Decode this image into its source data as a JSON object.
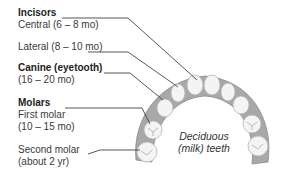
{
  "diagram": {
    "caption_line1": "Deciduous",
    "caption_line2": "(milk) teeth",
    "groups": [
      {
        "heading": "Incisors",
        "items": [
          {
            "name": "Central",
            "age": "Central (6 – 8 mo)"
          },
          {
            "name": "Lateral",
            "age": "Lateral (8 – 10 mo)"
          }
        ]
      },
      {
        "heading": "Canine (eyetooth)",
        "items": [
          {
            "name": "Canine",
            "age": "(16 – 20 mo)"
          }
        ]
      },
      {
        "heading": "Molars",
        "items": [
          {
            "name": "First molar",
            "label": "First molar",
            "age": "(10 – 15 mo)"
          },
          {
            "name": "Second molar",
            "label": "Second molar",
            "age": "(about 2 yr)"
          }
        ]
      }
    ],
    "colors": {
      "text": "#333333",
      "leader_line": "#444444",
      "gum": "#9a9a9a",
      "tooth": "#f4f4f4",
      "tooth_shadow": "#c8c8c8"
    }
  }
}
